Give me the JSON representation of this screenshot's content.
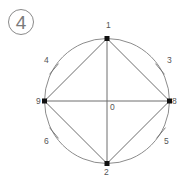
{
  "figure": {
    "number_badge": "4",
    "circle": {
      "cx": 107,
      "cy": 101,
      "r": 62.5,
      "stroke": "#8c8c8c"
    },
    "center": {
      "label": "0",
      "x": 107,
      "y": 101
    },
    "points": [
      {
        "id": "1",
        "label": "1",
        "x": 107,
        "y": 38.5,
        "lx": 106,
        "ly": 28
      },
      {
        "id": "2",
        "label": "2",
        "x": 107,
        "y": 163.5,
        "lx": 104,
        "ly": 175
      },
      {
        "id": "8",
        "label": "8",
        "x": 169.5,
        "y": 101,
        "lx": 172,
        "ly": 104
      },
      {
        "id": "9",
        "label": "9",
        "x": 44.5,
        "y": 101,
        "lx": 36,
        "ly": 104
      }
    ],
    "ticks": [
      {
        "label": "3",
        "x": 160,
        "y": 69,
        "angle": 50,
        "lx": 167,
        "ly": 63
      },
      {
        "label": "4",
        "x": 54,
        "y": 69,
        "angle": -50,
        "lx": 44,
        "ly": 63
      },
      {
        "label": "5",
        "x": 161,
        "y": 133,
        "angle": -50,
        "lx": 164,
        "ly": 144
      },
      {
        "label": "6",
        "x": 54,
        "y": 133,
        "angle": 50,
        "lx": 44,
        "ly": 144
      }
    ],
    "line_color": "#6e6e6e",
    "point_color": "#111111"
  }
}
